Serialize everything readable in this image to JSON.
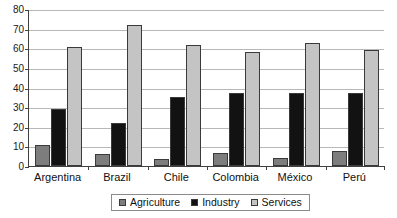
{
  "chart_data": {
    "type": "bar",
    "title": "",
    "subtitle": "",
    "xlabel": "",
    "ylabel": "",
    "ylim": [
      0,
      80
    ],
    "ytick_labels": [
      "0",
      "10",
      "20",
      "30",
      "40",
      "50",
      "60",
      "70",
      "80"
    ],
    "ytick_values": [
      0,
      10,
      20,
      30,
      40,
      50,
      60,
      70,
      80
    ],
    "grid": true,
    "legend_position": "bottom",
    "categories": [
      "Argentina",
      "Brazil",
      "Chile",
      "Colombia",
      "México",
      "Perú"
    ],
    "series": [
      {
        "name": "Agriculture",
        "color": "#7d7d7d",
        "values": [
          10.5,
          6,
          3.5,
          6.5,
          4,
          7.5
        ]
      },
      {
        "name": "Industry",
        "color": "#121212",
        "values": [
          29,
          22,
          35,
          37,
          37,
          37
        ]
      },
      {
        "name": "Services",
        "color": "#c4c4c4",
        "values": [
          60.5,
          72,
          61.5,
          58,
          62.5,
          59
        ]
      }
    ]
  },
  "legend": {
    "items": [
      {
        "label": "Agriculture",
        "color": "#7d7d7d"
      },
      {
        "label": "Industry",
        "color": "#121212"
      },
      {
        "label": "Services",
        "color": "#c4c4c4"
      }
    ]
  }
}
